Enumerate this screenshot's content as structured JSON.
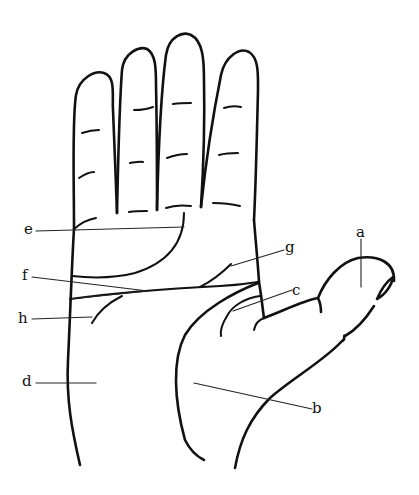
{
  "figure": {
    "stroke_color": "#111111",
    "background": "#ffffff"
  },
  "labels": {
    "a": "a",
    "b": "b",
    "c": "c",
    "d": "d",
    "e": "e",
    "f": "f",
    "g": "g",
    "h": "h"
  }
}
